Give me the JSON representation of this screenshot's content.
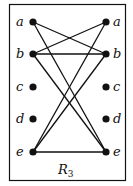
{
  "diagram": {
    "title": "R",
    "title_subscript": "3",
    "left_nodes": [
      "a",
      "b",
      "c",
      "d",
      "e"
    ],
    "right_nodes": [
      "a",
      "b",
      "c",
      "d",
      "e"
    ],
    "relation_pairs": [
      [
        "a",
        "b"
      ],
      [
        "a",
        "e"
      ],
      [
        "b",
        "a"
      ],
      [
        "b",
        "b"
      ],
      [
        "b",
        "e"
      ],
      [
        "e",
        "a"
      ],
      [
        "e",
        "b"
      ],
      [
        "e",
        "e"
      ]
    ],
    "colors": {
      "line": "#111111",
      "background": "#ffffff"
    }
  }
}
